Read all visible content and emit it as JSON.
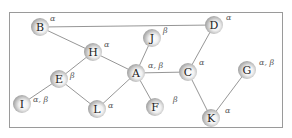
{
  "diagram": {
    "type": "graph",
    "edge_color": "#8a8a8a",
    "nodes": [
      {
        "id": "B",
        "label": "B",
        "x": 40,
        "y": 27,
        "tag": "α",
        "tx": 50,
        "ty": 15
      },
      {
        "id": "D",
        "label": "D",
        "x": 214,
        "y": 25,
        "tag": "α",
        "tx": 226,
        "ty": 14
      },
      {
        "id": "J",
        "label": "J",
        "x": 152,
        "y": 38,
        "tag": "β",
        "tx": 163,
        "ty": 27
      },
      {
        "id": "H",
        "label": "H",
        "x": 93,
        "y": 52,
        "tag": "α",
        "tx": 104,
        "ty": 41
      },
      {
        "id": "A",
        "label": "A",
        "x": 136,
        "y": 73,
        "tag": "α, β",
        "tx": 148,
        "ty": 62
      },
      {
        "id": "C",
        "label": "C",
        "x": 188,
        "y": 72,
        "tag": "α",
        "tx": 199,
        "ty": 59
      },
      {
        "id": "G",
        "label": "G",
        "x": 247,
        "y": 70,
        "tag": "α, β",
        "tx": 259,
        "ty": 59
      },
      {
        "id": "E",
        "label": "E",
        "x": 59,
        "y": 79,
        "tag": "β",
        "tx": 70,
        "ty": 72
      },
      {
        "id": "I",
        "label": "I",
        "x": 22,
        "y": 104,
        "tag": "α, β",
        "tx": 33,
        "ty": 96
      },
      {
        "id": "L",
        "label": "L",
        "x": 97,
        "y": 109,
        "tag": "α",
        "tx": 108,
        "ty": 102
      },
      {
        "id": "F",
        "label": "F",
        "x": 155,
        "y": 107,
        "tag": "β",
        "tx": 173,
        "ty": 96
      },
      {
        "id": "K",
        "label": "K",
        "x": 211,
        "y": 118,
        "tag": "α",
        "tx": 225,
        "ty": 107
      }
    ],
    "edges": [
      [
        "B",
        "D"
      ],
      [
        "B",
        "H"
      ],
      [
        "H",
        "E"
      ],
      [
        "H",
        "A"
      ],
      [
        "A",
        "J"
      ],
      [
        "A",
        "C"
      ],
      [
        "A",
        "F"
      ],
      [
        "A",
        "L"
      ],
      [
        "E",
        "I"
      ],
      [
        "E",
        "L"
      ],
      [
        "C",
        "D"
      ],
      [
        "C",
        "K"
      ],
      [
        "K",
        "G"
      ]
    ]
  }
}
